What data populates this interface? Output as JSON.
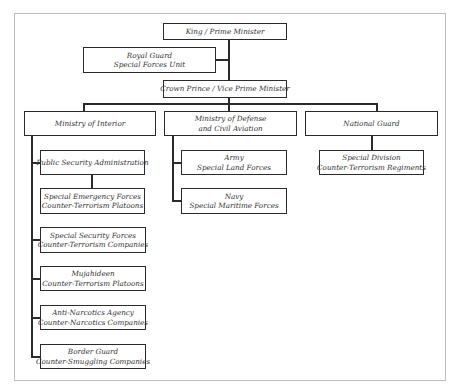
{
  "chart": {
    "nodes": {
      "king": {
        "line1": "King / Prime Minister"
      },
      "royal_guard": {
        "line1": "Royal Guard",
        "line2": "Special Forces Unit"
      },
      "crown_prince": {
        "line1": "Crown Prince / Vice Prime Minister"
      },
      "interior": {
        "line1": "Ministry of Interior"
      },
      "defense": {
        "line1": "Ministry of Defense",
        "line2": "and Civil Aviation"
      },
      "national_guard": {
        "line1": "National Guard"
      },
      "public_security": {
        "line1": "Public Security Administration"
      },
      "special_emergency": {
        "line1": "Special Emergency Forces",
        "line2": "Counter-Terrorism Platoons"
      },
      "special_security": {
        "line1": "Special Security Forces",
        "line2": "Counter-Terrorism Companies"
      },
      "mujahideen": {
        "line1": "Mujahideen",
        "line2": "Counter-Terrorism Platoons"
      },
      "anti_narcotics": {
        "line1": "Anti-Narcotics Agency",
        "line2": "Counter-Narcotics Companies"
      },
      "border_guard": {
        "line1": "Border Guard",
        "line2": "Counter-Smuggling Companies"
      },
      "army": {
        "line1": "Army",
        "line2": "Special Land Forces"
      },
      "navy": {
        "line1": "Navy",
        "line2": "Special Maritime Forces"
      },
      "special_division": {
        "line1": "Special Division",
        "line2": "Counter-Terrorism Regiments"
      }
    },
    "edges": [
      [
        "king",
        "royal_guard"
      ],
      [
        "king",
        "crown_prince"
      ],
      [
        "crown_prince",
        "interior"
      ],
      [
        "crown_prince",
        "defense"
      ],
      [
        "crown_prince",
        "national_guard"
      ],
      [
        "interior",
        "public_security"
      ],
      [
        "public_security",
        "special_emergency"
      ],
      [
        "interior",
        "special_security"
      ],
      [
        "interior",
        "mujahideen"
      ],
      [
        "interior",
        "anti_narcotics"
      ],
      [
        "interior",
        "border_guard"
      ],
      [
        "defense",
        "army"
      ],
      [
        "defense",
        "navy"
      ],
      [
        "national_guard",
        "special_division"
      ]
    ],
    "colors": {
      "line": "#2b2b2b",
      "frame": "#bdbdbd",
      "text": "#333333"
    }
  }
}
